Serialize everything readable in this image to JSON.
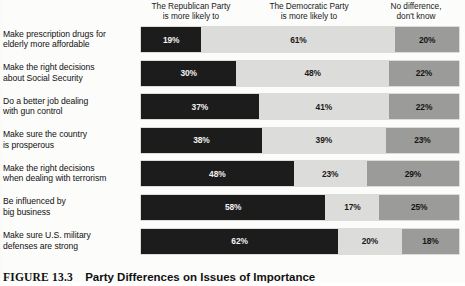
{
  "chart_data": {
    "type": "bar",
    "subtype": "stacked-horizontal-100",
    "title": "",
    "xlabel": "",
    "ylabel": "",
    "xlim": [
      0,
      100
    ],
    "grid": false,
    "legend_position": "top",
    "units": "%",
    "categories": [
      "Make prescription drugs for elderly more affordable",
      "Make the right decisions about Social Security",
      "Do a better job dealing with gun control",
      "Make sure the country is prosperous",
      "Make the right decisions when dealing with terrorism",
      "Be influenced by big business",
      "Make sure U.S. military defenses are strong"
    ],
    "series": [
      {
        "name": "The Republican Party is more likely to",
        "color": "#1c1c1c",
        "values": [
          19,
          30,
          37,
          38,
          48,
          58,
          62
        ]
      },
      {
        "name": "The Democratic Party is more likely to",
        "color": "#dcdcda",
        "values": [
          61,
          48,
          41,
          39,
          23,
          17,
          20
        ]
      },
      {
        "name": "No difference, don't know",
        "color": "#9b9b99",
        "values": [
          20,
          22,
          22,
          23,
          29,
          25,
          18
        ]
      }
    ]
  },
  "headers": {
    "republican": {
      "line1": "The Republican Party",
      "line2": "is more likely to"
    },
    "democratic": {
      "line1": "The Democratic Party",
      "line2": "is more likely to"
    },
    "nodiff": {
      "line1": "No difference,",
      "line2": "don't know"
    }
  },
  "rows": [
    {
      "label_line1": "Make prescription drugs for",
      "label_line2": "elderly more affordable",
      "rep": "19%",
      "dem": "61%",
      "none": "20%",
      "rep_pct": 19,
      "dem_pct": 61,
      "none_pct": 20
    },
    {
      "label_line1": "Make the right decisions",
      "label_line2": "about Social Security",
      "rep": "30%",
      "dem": "48%",
      "none": "22%",
      "rep_pct": 30,
      "dem_pct": 48,
      "none_pct": 22
    },
    {
      "label_line1": "Do a better job dealing",
      "label_line2": "with gun control",
      "rep": "37%",
      "dem": "41%",
      "none": "22%",
      "rep_pct": 37,
      "dem_pct": 41,
      "none_pct": 22
    },
    {
      "label_line1": "Make sure the country",
      "label_line2": "is prosperous",
      "rep": "38%",
      "dem": "39%",
      "none": "23%",
      "rep_pct": 38,
      "dem_pct": 39,
      "none_pct": 23
    },
    {
      "label_line1": "Make the right decisions",
      "label_line2": "when dealing with terrorism",
      "rep": "48%",
      "dem": "23%",
      "none": "29%",
      "rep_pct": 48,
      "dem_pct": 23,
      "none_pct": 29
    },
    {
      "label_line1": "Be influenced by",
      "label_line2": "big business",
      "rep": "58%",
      "dem": "17%",
      "none": "25%",
      "rep_pct": 58,
      "dem_pct": 17,
      "none_pct": 25
    },
    {
      "label_line1": "Make sure U.S. military",
      "label_line2": "defenses are strong",
      "rep": "62%",
      "dem": "20%",
      "none": "18%",
      "rep_pct": 62,
      "dem_pct": 20,
      "none_pct": 18
    }
  ],
  "caption": {
    "number": "FIGURE 13.3",
    "title": "Party Differences on Issues of Importance"
  },
  "colors": {
    "republican": "#1c1c1c",
    "democratic": "#dcdcda",
    "nodifference": "#9b9b99",
    "page_background": "#fcfcfb",
    "text": "#111111"
  }
}
